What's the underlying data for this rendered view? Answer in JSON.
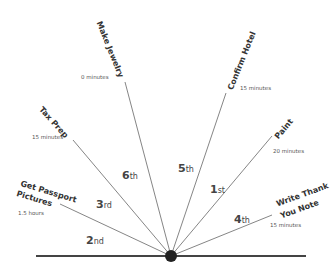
{
  "diagram": {
    "type": "radial-priority",
    "hub": {
      "x": 171,
      "y": 256
    },
    "baseline": {
      "x1": 36,
      "x2": 306,
      "y": 256
    },
    "colors": {
      "line": "#666666",
      "baseline": "#444444",
      "hub": "#222222",
      "text": "#333333"
    },
    "tasks": [
      {
        "name": "Make Jewelry",
        "duration": "0 minutes"
      },
      {
        "name": "Tax Prep",
        "duration": "15 minutes"
      },
      {
        "name": "Get Passport",
        "name2": "Pictures",
        "duration": "1.5 hours"
      },
      {
        "name": "Confirm Hotel",
        "duration": "15 minutes"
      },
      {
        "name": "Paint",
        "duration": "20 minutes"
      },
      {
        "name": "Write Thank",
        "name2": "You Note",
        "duration": "15 minutes"
      }
    ],
    "ordinals": [
      {
        "num": "6",
        "suffix": "th"
      },
      {
        "num": "3",
        "suffix": "rd"
      },
      {
        "num": "2",
        "suffix": "nd"
      },
      {
        "num": "5",
        "suffix": "th"
      },
      {
        "num": "1",
        "suffix": "st"
      },
      {
        "num": "4",
        "suffix": "th"
      }
    ]
  }
}
